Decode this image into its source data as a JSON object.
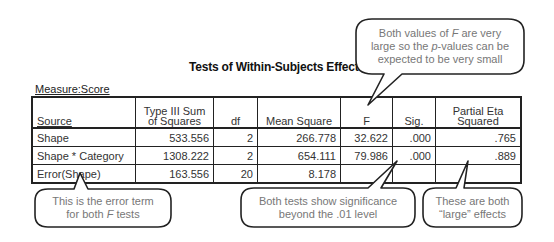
{
  "title": "Tests of Within-Subjects Effects",
  "measure_label": "Measure:Score",
  "table": {
    "headers": {
      "source": "Source",
      "ss_line1": "Type III Sum",
      "ss_line2": "of Squares",
      "df": "df",
      "ms": "Mean Square",
      "f": "F",
      "sig": "Sig.",
      "eta_line1": "Partial Eta",
      "eta_line2": "Squared"
    },
    "rows": [
      {
        "source": "Shape",
        "ss": "533.556",
        "df": "2",
        "ms": "266.778",
        "f": "32.622",
        "sig": ".000",
        "eta": ".765"
      },
      {
        "source": "Shape * Category",
        "ss": "1308.222",
        "df": "2",
        "ms": "654.111",
        "f": "79.986",
        "sig": ".000",
        "eta": ".889"
      },
      {
        "source": "Error(Shape)",
        "ss": "163.556",
        "df": "20",
        "ms": "8.178",
        "f": "",
        "sig": "",
        "eta": ""
      }
    ]
  },
  "callouts": {
    "top": {
      "line1_a": "Both values of ",
      "line1_italic": "F",
      "line1_b": " are very",
      "line2_a": "large so the ",
      "line2_italic": "p",
      "line2_b": "-values can be",
      "line3": "expected to be very small"
    },
    "error_term": {
      "line1": "This is the error term",
      "line2_a": "for both ",
      "line2_italic": "F",
      "line2_b": " tests"
    },
    "significance": {
      "line1": "Both tests show significance",
      "line2": "beyond the .01 level"
    },
    "effects": {
      "line1": "These are both",
      "line2": "“large” effects"
    }
  }
}
